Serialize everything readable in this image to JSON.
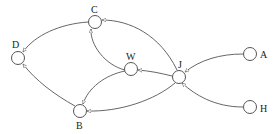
{
  "diagram": {
    "type": "directed-graph",
    "nodes": [
      {
        "id": "C",
        "label": "C",
        "x": 95,
        "y": 22,
        "lx": 91,
        "ly": 11
      },
      {
        "id": "D",
        "label": "D",
        "x": 18,
        "y": 58,
        "lx": 13,
        "ly": 47
      },
      {
        "id": "W",
        "label": "W",
        "x": 131,
        "y": 69,
        "lx": 126,
        "ly": 58
      },
      {
        "id": "J",
        "label": "J",
        "x": 179,
        "y": 77,
        "lx": 178,
        "ly": 65
      },
      {
        "id": "A",
        "label": "A",
        "x": 250,
        "y": 54,
        "lx": 260,
        "ly": 57
      },
      {
        "id": "H",
        "label": "H",
        "x": 250,
        "y": 107,
        "lx": 260,
        "ly": 111
      },
      {
        "id": "B",
        "label": "B",
        "x": 80,
        "y": 111,
        "lx": 76,
        "ly": 128
      }
    ],
    "edges": [
      {
        "from": "J",
        "to": "C"
      },
      {
        "from": "C",
        "to": "D"
      },
      {
        "from": "W",
        "to": "C"
      },
      {
        "from": "B",
        "to": "D"
      },
      {
        "from": "J",
        "to": "W"
      },
      {
        "from": "W",
        "to": "B"
      },
      {
        "from": "J",
        "to": "B"
      },
      {
        "from": "A",
        "to": "J"
      },
      {
        "from": "H",
        "to": "J"
      }
    ]
  }
}
